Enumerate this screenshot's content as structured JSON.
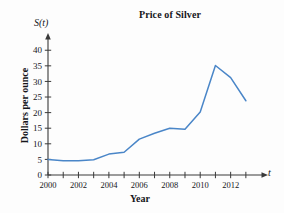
{
  "chart_data": {
    "type": "line",
    "title": "Price of Silver",
    "xlabel": "Year",
    "ylabel": "Dollars per ounce",
    "function_label": "S(t)",
    "axis_variable_label": "t",
    "grid": false,
    "legend": "none",
    "line_color": "#4a86c8",
    "axis_color": "#3a3a3a",
    "xlim": [
      2000,
      2013.6
    ],
    "ylim": [
      0,
      42
    ],
    "x_tick_values": [
      2000,
      2001,
      2002,
      2003,
      2004,
      2005,
      2006,
      2007,
      2008,
      2009,
      2010,
      2011,
      2012,
      2013
    ],
    "x_tick_labels": [
      "2000",
      "",
      "2002",
      "",
      "2004",
      "",
      "2006",
      "",
      "2008",
      "",
      "2010",
      "",
      "2012",
      ""
    ],
    "y_tick_values": [
      0,
      5,
      10,
      15,
      20,
      25,
      30,
      35,
      40
    ],
    "y_tick_labels": [
      "0",
      "5",
      "10",
      "15",
      "20",
      "25",
      "30",
      "35",
      "40"
    ],
    "x": [
      2000,
      2001,
      2002,
      2003,
      2004,
      2005,
      2006,
      2007,
      2008,
      2009,
      2010,
      2011,
      2012,
      2013
    ],
    "values": [
      5.0,
      4.6,
      4.6,
      4.9,
      6.7,
      7.3,
      11.5,
      13.4,
      15.0,
      14.7,
      20.2,
      35.1,
      31.2,
      23.8
    ],
    "series": [
      {
        "name": "Price of Silver",
        "values": [
          5.0,
          4.6,
          4.6,
          4.9,
          6.7,
          7.3,
          11.5,
          13.4,
          15.0,
          14.7,
          20.2,
          35.1,
          31.2,
          23.8
        ]
      }
    ]
  }
}
